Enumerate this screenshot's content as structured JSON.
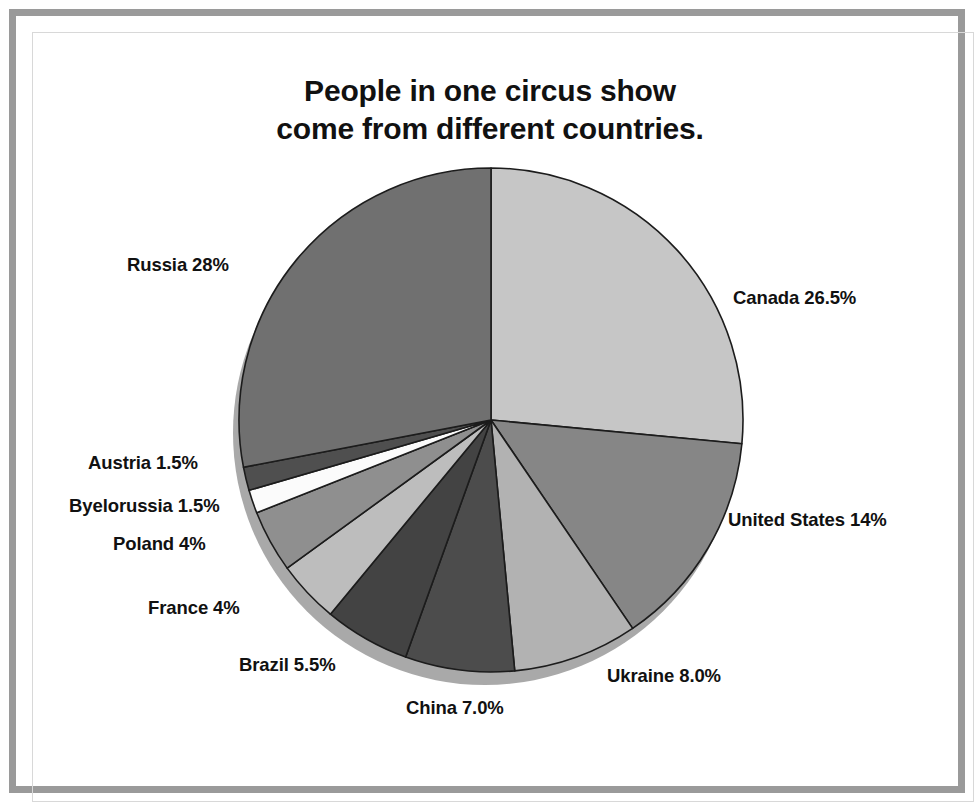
{
  "title": {
    "line1": "People in one circus show",
    "line2": "come from different countries."
  },
  "labels": {
    "russia": "Russia 28%",
    "canada": "Canada 26.5%",
    "united_states": "United States 14%",
    "ukraine": "Ukraine 8.0%",
    "china": "China 7.0%",
    "brazil": "Brazil 5.5%",
    "france": "France 4%",
    "poland": "Poland 4%",
    "byelorussia": "Byelorussia 1.5%",
    "austria": "Austria 1.5%"
  },
  "chart_data": {
    "type": "pie",
    "title": "People in one circus show come from different countries.",
    "xlabel": "",
    "ylabel": "",
    "units": "percent",
    "total": 100,
    "start_angle_deg": 0,
    "direction": "clockwise",
    "legend": "none (labels placed around pie)",
    "grid": false,
    "categories": [
      "Canada",
      "United States",
      "Ukraine",
      "China",
      "Brazil",
      "France",
      "Poland",
      "Byelorussia",
      "Austria",
      "Russia"
    ],
    "values": [
      26.5,
      14.0,
      8.0,
      7.0,
      5.5,
      4.0,
      4.0,
      1.5,
      1.5,
      28.0
    ],
    "slices": [
      {
        "name": "Canada",
        "label": "Canada 26.5%",
        "value": 26.5,
        "color": "#c6c6c6"
      },
      {
        "name": "United States",
        "label": "United States 14%",
        "value": 14.0,
        "color": "#868686"
      },
      {
        "name": "Ukraine",
        "label": "Ukraine 8.0%",
        "value": 8.0,
        "color": "#b2b2b2"
      },
      {
        "name": "China",
        "label": "China 7.0%",
        "value": 7.0,
        "color": "#4c4c4c"
      },
      {
        "name": "Brazil",
        "label": "Brazil 5.5%",
        "value": 5.5,
        "color": "#434343"
      },
      {
        "name": "France",
        "label": "France 4%",
        "value": 4.0,
        "color": "#bdbdbd"
      },
      {
        "name": "Poland",
        "label": "Poland 4%",
        "value": 4.0,
        "color": "#8f8f8f"
      },
      {
        "name": "Byelorussia",
        "label": "Byelorussia 1.5%",
        "value": 1.5,
        "color": "#fbfbfb"
      },
      {
        "name": "Austria",
        "label": "Austria 1.5%",
        "value": 1.5,
        "color": "#4f4f4f"
      },
      {
        "name": "Russia",
        "label": "Russia 28%",
        "value": 28.0,
        "color": "#707070"
      }
    ],
    "colors": {
      "slice_outline": "#1c1c1c",
      "shadow_rim": "#a9a9a9",
      "frame": "#9a9a9a",
      "text": "#111111",
      "background": "#ffffff"
    }
  }
}
